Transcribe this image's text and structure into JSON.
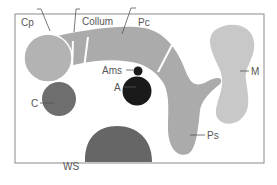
{
  "diagram": {
    "type": "anatomical-schematic",
    "labels": {
      "cp": "Cp",
      "collum": "Collum",
      "pc": "Pc",
      "ams": "Ams",
      "a": "A",
      "c": "C",
      "m": "M",
      "ps": "Ps",
      "ws": "WS"
    },
    "colors": {
      "frame": "#7a7a7a",
      "light_gray": "#bdbdbd",
      "mid_gray": "#a9a9a9",
      "dark_gray": "#6e6e6e",
      "darker_gray": "#666666",
      "black": "#1a1a1a",
      "m_region": "#c8c8c8"
    }
  }
}
